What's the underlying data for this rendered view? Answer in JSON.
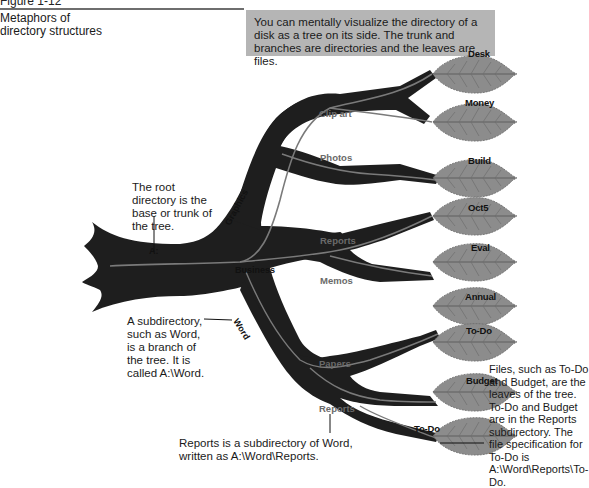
{
  "figure": {
    "label": "Figure 1-12",
    "side_title": "Metaphors of directory structures",
    "callout": "You can mentally visualize the directory of a disk as a tree on its side. The trunk and branches are directories and the leaves are files."
  },
  "tree": {
    "root_label": "A:",
    "branches": {
      "graphics": "Graphics",
      "business": "Business",
      "word": "Word",
      "clip_art": "Clip art",
      "photos": "Photos",
      "reports_business": "Reports",
      "memos": "Memos",
      "papers": "Papers",
      "reports_word": "Reports"
    },
    "leaves": [
      "Desk",
      "Money",
      "Build",
      "Oct5",
      "Eval",
      "Annual",
      "To-Do",
      "Budget",
      "To-Do"
    ],
    "colors": {
      "trunk": "#1e1e1e",
      "vein": "#7a7a7a",
      "leaf": "#8c8c8c",
      "leaf_vein": "#5e5e5e",
      "callout_bg": "#b5b5b5"
    }
  },
  "annotations": {
    "root": "The root directory is the base or trunk of the tree.",
    "subdirectory": "A subdirectory, such as Word, is a branch of the tree. It is called A:\\Word.",
    "reports": "Reports is a subdirectory of Word, written as A:\\Word\\Reports.",
    "files": "Files, such as To-Do and Budget, are the leaves of the tree. To-Do and Budget are in the Reports subdirectory. The file specification for To-Do is A:\\Word\\Reports\\To-Do."
  }
}
